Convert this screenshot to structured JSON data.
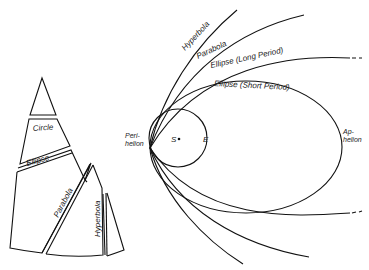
{
  "figure": {
    "type": "diagram"
  },
  "cone": {
    "sections": [
      {
        "label": "Circle"
      },
      {
        "label": "Ellipse"
      },
      {
        "label": "Parabola"
      },
      {
        "label": "Hyperbola"
      }
    ]
  },
  "orbits": {
    "labels": {
      "hyperbola": "Hyperbola",
      "parabola": "Parabola",
      "ellipse_long": "Ellipse (Long Period)",
      "ellipse_short": "Ellipse (Short Period)"
    },
    "sun_label": "S",
    "earth_label": "E",
    "perihelion": {
      "line1": "Peri-",
      "line2": "helion"
    },
    "aphelion": {
      "line1": "Ap-",
      "line2": "helion"
    }
  },
  "colors": {
    "line": "#111111",
    "background": "#ffffff"
  }
}
